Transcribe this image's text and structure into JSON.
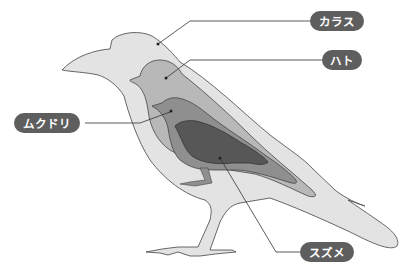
{
  "labels": {
    "crow": "カラス",
    "pigeon": "ハト",
    "starling": "ムクドリ",
    "sparrow": "スズメ"
  },
  "colors": {
    "crow": "#e3e3e3",
    "pigeon": "#b8b8b8",
    "starling": "#8f8f8f",
    "sparrow": "#575757",
    "outline": "#444444",
    "label_bg": "#5e5e5e",
    "label_text": "#ffffff"
  }
}
